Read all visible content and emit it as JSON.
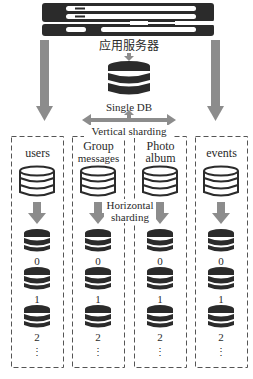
{
  "diagram": {
    "server": {
      "label": "应用服务器",
      "icon": "server-rack-icon"
    },
    "single_db": {
      "label": "Single DB",
      "icon": "database-icon"
    },
    "vertical_sharding": {
      "label": "Vertical sharding"
    },
    "horizontal_sharding": {
      "label_line1": "Horizontal",
      "label_line2": "sharding"
    },
    "columns": [
      {
        "title_line1": "users",
        "title_line2": "",
        "shards": [
          "0",
          "1",
          "2"
        ],
        "more": "⋮"
      },
      {
        "title_line1": "Group",
        "title_line2": "messages",
        "shards": [
          "0",
          "1",
          "2"
        ],
        "more": "⋮"
      },
      {
        "title_line1": "Photo",
        "title_line2": "album",
        "shards": [
          "0",
          "1",
          "2"
        ],
        "more": "⋮"
      },
      {
        "title_line1": "events",
        "title_line2": "",
        "shards": [
          "0",
          "1",
          "2"
        ],
        "more": "⋮"
      }
    ],
    "colors": {
      "dark": "#2b2b2b",
      "arrow": "#8c8c8c",
      "dash": "#555555"
    }
  }
}
